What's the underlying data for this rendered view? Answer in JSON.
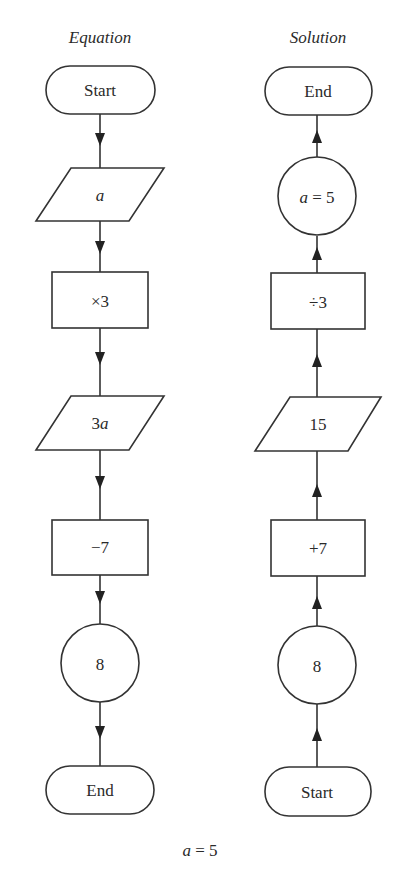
{
  "diagram": {
    "columns": [
      {
        "title": "Equation",
        "direction": "down",
        "nodes": [
          {
            "id": "eq-start",
            "shape": "terminal",
            "label": "Start"
          },
          {
            "id": "eq-input",
            "shape": "parallelogram",
            "label": "a"
          },
          {
            "id": "eq-op1",
            "shape": "rectangle",
            "label": "×3"
          },
          {
            "id": "eq-mid",
            "shape": "parallelogram",
            "label": "3a"
          },
          {
            "id": "eq-op2",
            "shape": "rectangle",
            "label": "−7"
          },
          {
            "id": "eq-result",
            "shape": "circle",
            "label": "8"
          },
          {
            "id": "eq-end",
            "shape": "terminal",
            "label": "End"
          }
        ]
      },
      {
        "title": "Solution",
        "direction": "up",
        "nodes": [
          {
            "id": "sol-end",
            "shape": "terminal",
            "label": "End"
          },
          {
            "id": "sol-result",
            "shape": "circle",
            "label": "a = 5"
          },
          {
            "id": "sol-op2",
            "shape": "rectangle",
            "label": "÷3"
          },
          {
            "id": "sol-mid",
            "shape": "parallelogram",
            "label": "15"
          },
          {
            "id": "sol-op1",
            "shape": "rectangle",
            "label": "+7"
          },
          {
            "id": "sol-input",
            "shape": "circle",
            "label": "8"
          },
          {
            "id": "sol-start",
            "shape": "terminal",
            "label": "Start"
          }
        ]
      }
    ],
    "edges": [
      {
        "from": "eq-start",
        "to": "eq-input"
      },
      {
        "from": "eq-input",
        "to": "eq-op1"
      },
      {
        "from": "eq-op1",
        "to": "eq-mid"
      },
      {
        "from": "eq-mid",
        "to": "eq-op2"
      },
      {
        "from": "eq-op2",
        "to": "eq-result"
      },
      {
        "from": "eq-result",
        "to": "eq-end"
      },
      {
        "from": "sol-start",
        "to": "sol-input"
      },
      {
        "from": "sol-input",
        "to": "sol-op1"
      },
      {
        "from": "sol-op1",
        "to": "sol-mid"
      },
      {
        "from": "sol-mid",
        "to": "sol-op2"
      },
      {
        "from": "sol-op2",
        "to": "sol-result"
      },
      {
        "from": "sol-result",
        "to": "sol-end"
      }
    ],
    "caption": "a = 5"
  }
}
